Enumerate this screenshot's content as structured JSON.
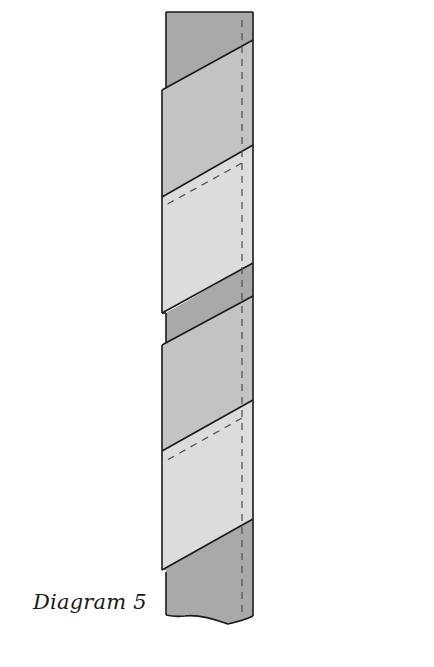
{
  "caption": "Diagram 5",
  "diagram": {
    "colors": {
      "dark_fabric": "#a9a9a9",
      "medium_fabric": "#c4c4c4",
      "light_fabric": "#dcdcdc",
      "outline": "#1a1a1a",
      "stitch_line": "#555555",
      "background": "#ffffff"
    },
    "segments": [
      {
        "name": "top-core",
        "shade": "dark"
      },
      {
        "name": "band-1-outer",
        "shade": "medium"
      },
      {
        "name": "band-1-inner",
        "shade": "light"
      },
      {
        "name": "middle-core",
        "shade": "dark"
      },
      {
        "name": "band-2-outer",
        "shade": "medium"
      },
      {
        "name": "band-2-inner",
        "shade": "light"
      },
      {
        "name": "bottom-core",
        "shade": "dark"
      }
    ]
  }
}
